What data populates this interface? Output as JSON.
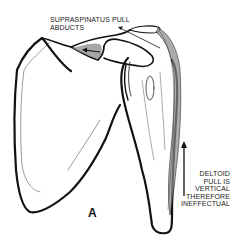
{
  "figure": {
    "letter": "A",
    "labels": {
      "supraspinatus": [
        "SUPRASPINATUS PULL",
        "ABDUCTS"
      ],
      "deltoid": [
        "DELTOID",
        "PULL IS",
        "VERTICAL",
        "THEREFORE",
        "INEFFECTUAL"
      ]
    },
    "arrows": [
      {
        "name": "supraspinatus-pull-arrow",
        "direction": "left"
      },
      {
        "name": "deltoid-pull-arrow",
        "direction": "up"
      }
    ],
    "colors": {
      "ink": "#111111",
      "muscle_fill": "#8a8a8a",
      "background": "#ffffff"
    }
  }
}
